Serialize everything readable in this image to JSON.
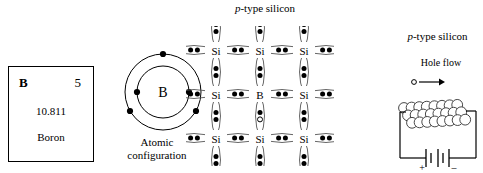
{
  "figure": {
    "lattice_title_italic": "p",
    "lattice_title_rest": "-type silicon",
    "circuit_title_italic": "p",
    "circuit_title_rest": "-type silicon",
    "hole_flow_label": "Hole flow"
  },
  "element_box": {
    "symbol": "B",
    "atomic_number": "5",
    "atomic_mass": "10.811",
    "name": "Boron"
  },
  "bohr": {
    "nucleus_label": "B",
    "caption_line1": "Atomic",
    "caption_line2": "configuration",
    "inner_shell_electrons": 2,
    "outer_shell_electrons": 3
  },
  "lattice": {
    "atoms": [
      [
        "Si",
        "Si",
        "Si"
      ],
      [
        "Si",
        "B",
        "Si"
      ],
      [
        "Si",
        "Si",
        "Si"
      ]
    ],
    "dopant_label": "B",
    "host_label": "Si",
    "hole_present": true
  },
  "circuit": {
    "battery_positive": "+",
    "battery_negative": "–"
  },
  "colors": {
    "ink": "#000000",
    "bond": "#555555"
  }
}
